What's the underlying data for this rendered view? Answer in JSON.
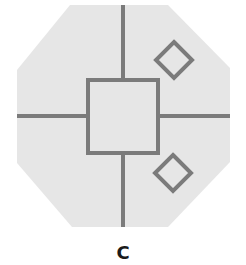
{
  "figure": {
    "label": "C",
    "colors": {
      "fill": "#e6e6e6",
      "stroke": "#7b7b7b",
      "label": "#1a1a1a"
    },
    "shapes": {
      "outer": "octagon",
      "center": "square",
      "dividers": [
        "top-line",
        "bottom-line",
        "left-line",
        "right-line"
      ],
      "markers": [
        {
          "shape": "diamond",
          "quadrant": "top-right"
        },
        {
          "shape": "diamond",
          "quadrant": "bottom-right"
        }
      ]
    }
  }
}
